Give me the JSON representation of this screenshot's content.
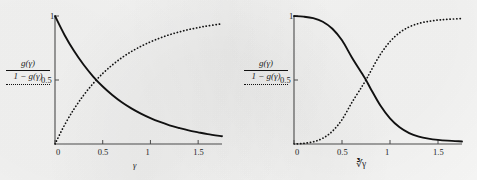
{
  "figure": {
    "background_color": "#fbfbfa",
    "ink_color": "#111111",
    "panels": [
      {
        "id": "left",
        "legend": {
          "solid_label": "g(γ)",
          "dotted_label": "1 − g(γ)",
          "solid_style": "solid",
          "dotted_style": "dotted"
        }
      },
      {
        "id": "right",
        "legend": {
          "solid_label": "g(γ)",
          "dotted_label": "1 − g(γ)",
          "solid_style": "solid",
          "dotted_style": "dotted"
        }
      }
    ]
  },
  "chart_data": [
    {
      "type": "line",
      "id": "left-panel-exponential",
      "title": "",
      "xlabel": "γ",
      "ylabel": "",
      "xlim": [
        0,
        1.75
      ],
      "ylim": [
        0,
        1.0
      ],
      "xticks": [
        0,
        0.5,
        1,
        1.5
      ],
      "xticklabels": [
        "0",
        "0.5",
        "1",
        "1.5"
      ],
      "yticks": [
        0.5,
        1
      ],
      "yticklabels": [
        "0.5",
        "1"
      ],
      "grid": false,
      "legend_position": "left-outside",
      "crossing_point": [
        0.43,
        0.5
      ],
      "series": [
        {
          "name": "g(γ)",
          "style": "solid",
          "x": [
            0,
            0.1,
            0.2,
            0.3,
            0.4,
            0.5,
            0.6,
            0.7,
            0.8,
            0.9,
            1.0,
            1.1,
            1.2,
            1.3,
            1.4,
            1.5,
            1.6,
            1.75
          ],
          "values": [
            1.0,
            0.852,
            0.726,
            0.619,
            0.527,
            0.449,
            0.383,
            0.326,
            0.278,
            0.237,
            0.202,
            0.172,
            0.146,
            0.125,
            0.106,
            0.091,
            0.077,
            0.061
          ]
        },
        {
          "name": "1 − g(γ)",
          "style": "dotted",
          "x": [
            0,
            0.1,
            0.2,
            0.3,
            0.4,
            0.5,
            0.6,
            0.7,
            0.8,
            0.9,
            1.0,
            1.1,
            1.2,
            1.3,
            1.4,
            1.5,
            1.6,
            1.75
          ],
          "values": [
            0.0,
            0.148,
            0.274,
            0.381,
            0.473,
            0.551,
            0.617,
            0.674,
            0.722,
            0.763,
            0.798,
            0.828,
            0.854,
            0.875,
            0.894,
            0.909,
            0.923,
            0.939
          ]
        }
      ]
    },
    {
      "type": "line",
      "id": "right-panel-sigmoid",
      "title": "",
      "xlabel": "∛γ",
      "ylabel": "",
      "xlim": [
        0,
        1.75
      ],
      "ylim": [
        0,
        1.0
      ],
      "xticks": [
        0,
        0.5,
        1,
        1.5
      ],
      "xticklabels": [
        "0",
        "0.5",
        "1",
        "1.5"
      ],
      "yticks": [
        0.5,
        1
      ],
      "yticklabels": [
        "0.5",
        "1"
      ],
      "grid": false,
      "legend_position": "left-outside",
      "crossing_point": [
        0.75,
        0.5
      ],
      "series": [
        {
          "name": "g(γ)",
          "style": "solid",
          "x": [
            0,
            0.1,
            0.2,
            0.3,
            0.4,
            0.5,
            0.6,
            0.7,
            0.75,
            0.8,
            0.9,
            1.0,
            1.1,
            1.2,
            1.3,
            1.4,
            1.5,
            1.6,
            1.75
          ],
          "values": [
            1.0,
            0.995,
            0.983,
            0.955,
            0.9,
            0.81,
            0.68,
            0.56,
            0.5,
            0.43,
            0.3,
            0.2,
            0.13,
            0.085,
            0.058,
            0.042,
            0.032,
            0.026,
            0.02
          ]
        },
        {
          "name": "1 − g(γ)",
          "style": "dotted",
          "x": [
            0,
            0.1,
            0.2,
            0.3,
            0.4,
            0.5,
            0.6,
            0.7,
            0.75,
            0.8,
            0.9,
            1.0,
            1.1,
            1.2,
            1.3,
            1.4,
            1.5,
            1.6,
            1.75
          ],
          "values": [
            0.0,
            0.005,
            0.017,
            0.045,
            0.1,
            0.19,
            0.32,
            0.44,
            0.5,
            0.57,
            0.7,
            0.8,
            0.87,
            0.915,
            0.942,
            0.958,
            0.968,
            0.974,
            0.98
          ]
        }
      ]
    }
  ]
}
